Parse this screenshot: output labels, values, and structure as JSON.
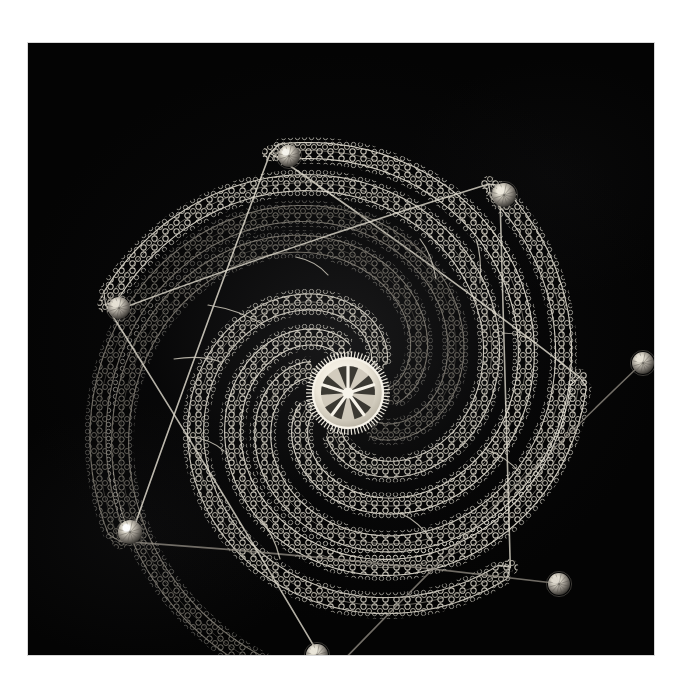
{
  "image": {
    "domain_description": "Photograph of a handmade spiral tatted-lace ornament on a black backdrop",
    "canvas_width": 683,
    "canvas_height": 691,
    "paper_color": "#ffffff",
    "photo": {
      "left": 28,
      "top": 43,
      "width": 626,
      "height": 612,
      "backdrop_color": "#040404",
      "edge_color": "#d8d8d8"
    }
  },
  "subject": {
    "name": "spiral-lace-ornament",
    "technique": "tatted lace with beaded arm tips",
    "thread_color": "#d9d4c8",
    "thread_highlight": "#f2efe6",
    "thread_shadow": "#6a6760",
    "arm_count": 7,
    "bead_count": 7,
    "rotation_direction": "counter-clockwise",
    "center": {
      "cx": 320,
      "cy": 350
    }
  },
  "medallion": {
    "name": "center-medallion",
    "cx": 320,
    "cy": 350,
    "outer_radius": 42,
    "ring_radius": 35,
    "inner_radius": 27,
    "spoke_count": 5,
    "rim_tick_count": 72,
    "fill_color": "#efeade",
    "ring_color": "#f6f2e8",
    "inner_color": "#cdc7b8",
    "slot_color": "#1a1814"
  },
  "arms": [
    {
      "id": "arm-1",
      "label": "upper-left arm",
      "start_angle_deg": 96,
      "sweep_deg": 268,
      "r_start": 44,
      "r_end": 232,
      "band_width": 16,
      "brightness": 0.92,
      "tip": {
        "x": 258,
        "y": 120,
        "bead": "bead-1"
      }
    },
    {
      "id": "arm-2",
      "label": "upper-right arm",
      "start_angle_deg": 45,
      "sweep_deg": 268,
      "r_start": 44,
      "r_end": 238,
      "band_width": 16,
      "brightness": 0.88,
      "tip": {
        "x": 472,
        "y": 155,
        "bead": "bead-2"
      }
    },
    {
      "id": "arm-3",
      "label": "right arm",
      "start_angle_deg": 356,
      "sweep_deg": 268,
      "r_start": 44,
      "r_end": 296,
      "band_width": 17,
      "brightness": 0.82,
      "tip": {
        "x": 612,
        "y": 322,
        "bead": "bead-3"
      }
    },
    {
      "id": "arm-4",
      "label": "lower-right arm",
      "start_angle_deg": 305,
      "sweep_deg": 268,
      "r_start": 44,
      "r_end": 272,
      "band_width": 16,
      "brightness": 0.8,
      "tip": {
        "x": 534,
        "y": 541,
        "bead": "bead-4"
      }
    },
    {
      "id": "arm-5",
      "label": "bottom arm",
      "start_angle_deg": 252,
      "sweep_deg": 268,
      "r_start": 44,
      "r_end": 258,
      "band_width": 16,
      "brightness": 0.9,
      "tip": {
        "x": 290,
        "y": 610,
        "bead": "bead-5"
      }
    },
    {
      "id": "arm-6",
      "label": "lower-left arm",
      "start_angle_deg": 200,
      "sweep_deg": 268,
      "r_start": 44,
      "r_end": 252,
      "band_width": 16,
      "brightness": 0.94,
      "tip": {
        "x": 104,
        "y": 490,
        "bead": "bead-6"
      }
    },
    {
      "id": "arm-7",
      "label": "left arm",
      "start_angle_deg": 148,
      "sweep_deg": 268,
      "r_start": 44,
      "r_end": 252,
      "band_width": 16,
      "brightness": 0.9,
      "tip": {
        "x": 92,
        "y": 266,
        "bead": "bead-7"
      }
    }
  ],
  "beads": [
    {
      "id": "bead-1",
      "x": 261,
      "y": 113,
      "r": 11,
      "highlight": "#f7f5ee",
      "body": "#9d998f",
      "label": "faceted crystal bead top"
    },
    {
      "id": "bead-2",
      "x": 476,
      "y": 152,
      "r": 12,
      "highlight": "#efeade",
      "body": "#928d83",
      "label": "faceted crystal bead upper right"
    },
    {
      "id": "bead-3",
      "x": 615,
      "y": 320,
      "r": 11,
      "highlight": "#e8e3d6",
      "body": "#8b867c",
      "label": "faceted crystal bead right"
    },
    {
      "id": "bead-4",
      "x": 531,
      "y": 541,
      "r": 11,
      "highlight": "#ded9cd",
      "body": "#837e75",
      "label": "faceted crystal bead lower right"
    },
    {
      "id": "bead-5",
      "x": 289,
      "y": 612,
      "r": 11,
      "highlight": "#ebe7da",
      "body": "#8d8880",
      "label": "faceted crystal bead bottom"
    },
    {
      "id": "bead-6",
      "x": 102,
      "y": 489,
      "r": 12,
      "highlight": "#ffffff",
      "body": "#9a958b",
      "label": "faceted crystal bead lower left"
    },
    {
      "id": "bead-7",
      "x": 91,
      "y": 265,
      "r": 11,
      "highlight": "#e6e1d4",
      "body": "#8e8980",
      "label": "faceted crystal bead left"
    }
  ],
  "connectors": [
    {
      "id": "connector-1",
      "x1": 180,
      "y1": 262,
      "x2": 236,
      "y2": 282,
      "label": "thread stay upper left"
    },
    {
      "id": "connector-2",
      "x1": 392,
      "y1": 196,
      "x2": 408,
      "y2": 236,
      "label": "thread stay top"
    },
    {
      "id": "connector-3",
      "x1": 448,
      "y1": 196,
      "x2": 452,
      "y2": 240,
      "label": "thread stay top right"
    },
    {
      "id": "connector-4",
      "x1": 474,
      "y1": 290,
      "x2": 508,
      "y2": 300,
      "label": "thread stay right"
    },
    {
      "id": "connector-5",
      "x1": 456,
      "y1": 406,
      "x2": 492,
      "y2": 430,
      "label": "thread stay lower right"
    },
    {
      "id": "connector-6",
      "x1": 372,
      "y1": 470,
      "x2": 404,
      "y2": 498,
      "label": "thread stay bottom right"
    },
    {
      "id": "connector-7",
      "x1": 232,
      "y1": 476,
      "x2": 252,
      "y2": 516,
      "label": "thread stay bottom"
    },
    {
      "id": "connector-8",
      "x1": 162,
      "y1": 394,
      "x2": 196,
      "y2": 408,
      "label": "thread stay lower left"
    },
    {
      "id": "connector-9",
      "x1": 146,
      "y1": 316,
      "x2": 190,
      "y2": 318,
      "label": "thread stay left"
    },
    {
      "id": "connector-10",
      "x1": 268,
      "y1": 214,
      "x2": 300,
      "y2": 232,
      "label": "thread stay inner top"
    }
  ]
}
